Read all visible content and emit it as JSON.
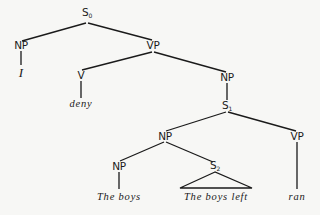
{
  "diagram": {
    "type": "syntax-tree",
    "nodes": {
      "s0": {
        "label": "S",
        "sub": "0"
      },
      "np_subj": {
        "label": "NP"
      },
      "word_i": {
        "label": "I"
      },
      "vp_main": {
        "label": "VP"
      },
      "v": {
        "label": "V"
      },
      "word_deny": {
        "label": "deny"
      },
      "np_obj": {
        "label": "NP"
      },
      "s1": {
        "label": "S",
        "sub": "1"
      },
      "np_s1": {
        "label": "NP"
      },
      "vp_s1": {
        "label": "VP"
      },
      "np_head": {
        "label": "NP"
      },
      "s2": {
        "label": "S",
        "sub": "2"
      },
      "word_the_boys": {
        "label": "The boys"
      },
      "word_the_boys_left": {
        "label": "The boys left"
      },
      "word_ran": {
        "label": "ran"
      }
    },
    "edges": [
      [
        "s0",
        "np_subj"
      ],
      [
        "s0",
        "vp_main"
      ],
      [
        "np_subj",
        "word_i"
      ],
      [
        "vp_main",
        "v"
      ],
      [
        "vp_main",
        "np_obj"
      ],
      [
        "v",
        "word_deny"
      ],
      [
        "np_obj",
        "s1"
      ],
      [
        "s1",
        "np_s1"
      ],
      [
        "s1",
        "vp_s1"
      ],
      [
        "np_s1",
        "np_head"
      ],
      [
        "np_s1",
        "s2"
      ],
      [
        "np_head",
        "word_the_boys"
      ],
      [
        "s2",
        "word_the_boys_left",
        "triangle"
      ],
      [
        "vp_s1",
        "word_ran"
      ]
    ]
  }
}
